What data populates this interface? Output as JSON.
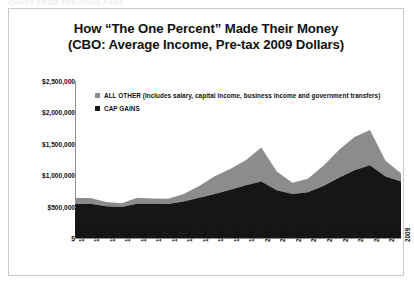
{
  "page": {
    "bleed_text": "CHART FROM PREVIOUS PAGE"
  },
  "title": {
    "line1": "How “The One Percent” Made Their Money",
    "line2": "(CBO: Average Income, Pre-tax 2009 Dollars)"
  },
  "legend": {
    "position": "inside-top-left",
    "items": [
      {
        "label": "ALL OTHER (Includes salary, capital income, business income and government transfers)",
        "color": "#8c8c8c",
        "name": "all-other"
      },
      {
        "label": "CAP GAINS",
        "color": "#161616",
        "name": "cap-gains"
      }
    ]
  },
  "axes": {
    "y_ticks": [
      "$2,500,000",
      "$2,000,000",
      "$1,500,000",
      "$1,000,000",
      "$500,000",
      "$"
    ],
    "y_values": [
      2500000,
      2000000,
      1500000,
      1000000,
      500000,
      0
    ]
  },
  "chart_data": {
    "type": "area",
    "stacked": true,
    "title": "How “The One Percent” Made Their Money (CBO: Average Income, Pre-tax 2009 Dollars)",
    "xlabel": "",
    "ylabel": "",
    "ylim": [
      0,
      2500000
    ],
    "yticks": [
      0,
      500000,
      1000000,
      1500000,
      2000000,
      2500000
    ],
    "ytick_labels": [
      "$",
      "$500,000",
      "$1,000,000",
      "$1,500,000",
      "$2,000,000",
      "$2,500,000"
    ],
    "grid": false,
    "legend_position": "upper left",
    "categories": [
      "1988",
      "1989",
      "1990",
      "1991",
      "1992",
      "1993",
      "1994",
      "1995",
      "1996",
      "1997",
      "1998",
      "1999",
      "2000",
      "2001",
      "2002",
      "2003",
      "2004",
      "2005",
      "2006",
      "2007",
      "2008",
      "2009"
    ],
    "series": [
      {
        "name": "CAP GAINS",
        "color": "#161616",
        "values": [
          540000,
          545000,
          505000,
          495000,
          545000,
          545000,
          540000,
          580000,
          640000,
          700000,
          770000,
          840000,
          900000,
          760000,
          700000,
          730000,
          830000,
          960000,
          1080000,
          1160000,
          980000,
          900000
        ]
      },
      {
        "name": "ALL OTHER (Includes salary, capital income, business income and government transfers)",
        "color": "#8c8c8c",
        "values": [
          95000,
          90000,
          70000,
          60000,
          95000,
          85000,
          85000,
          120000,
          190000,
          285000,
          330000,
          400000,
          540000,
          300000,
          180000,
          215000,
          320000,
          440000,
          530000,
          560000,
          250000,
          130000
        ]
      }
    ],
    "totals": [
      635000,
      635000,
      575000,
      555000,
      640000,
      630000,
      625000,
      700000,
      830000,
      985000,
      1100000,
      1240000,
      1440000,
      1060000,
      880000,
      945000,
      1150000,
      1400000,
      1610000,
      1720000,
      1230000,
      1030000
    ]
  }
}
